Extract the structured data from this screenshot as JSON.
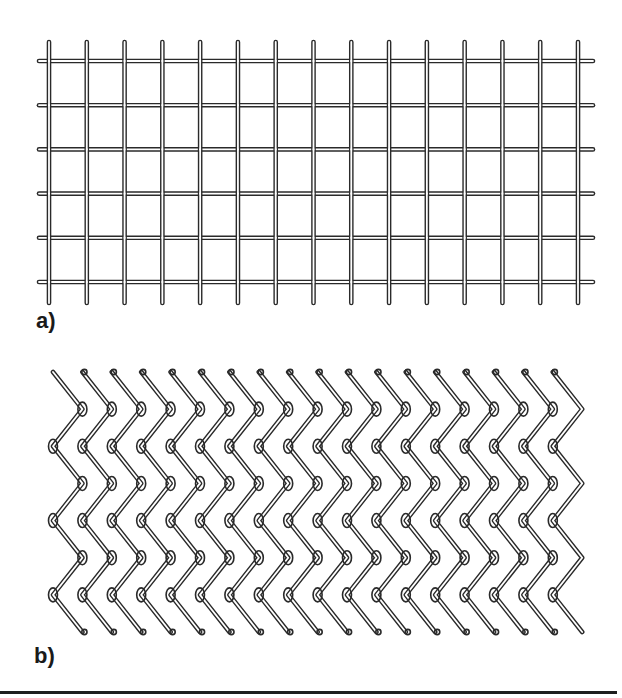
{
  "figure": {
    "panels": [
      {
        "id": "a",
        "label": "a)",
        "caption": "welded wire mesh",
        "grid": {
          "vertical_wires": 15,
          "x_first": 49,
          "x_last": 578,
          "y_top": 42,
          "y_bottom": 303,
          "horizontal_wires": 6,
          "y_first": 61,
          "y_last": 282,
          "x_left": 39,
          "x_right": 593
        }
      },
      {
        "id": "b",
        "label": "b)",
        "caption": "chain-link (twisted diamond) mesh",
        "chainlink": {
          "x_left": 53,
          "x_right": 583,
          "y_top": 372,
          "y_bottom": 632,
          "pitch_x": 29.4,
          "row_spacing": 35
        }
      }
    ],
    "colors": {
      "wire_outline": "#2a2a2a",
      "wire_core": "#ffffff",
      "rule": "#1e1e1e"
    }
  }
}
